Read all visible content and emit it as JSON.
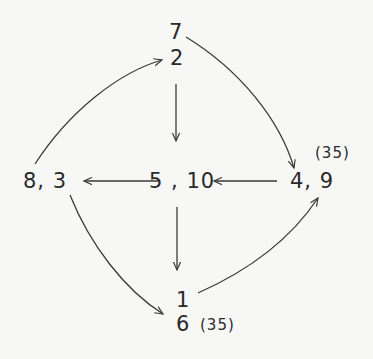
{
  "diagram": {
    "type": "directed-graph",
    "style": "hand-drawn",
    "colors": {
      "background": "#f7f7f6",
      "ink": "#2a2a2a"
    },
    "nodes": [
      {
        "id": "top",
        "lines": [
          "7",
          "2"
        ],
        "annotation": ""
      },
      {
        "id": "left",
        "label": "8, 3",
        "annotation": ""
      },
      {
        "id": "center",
        "label": "5 , 10",
        "annotation": ""
      },
      {
        "id": "right",
        "label": "4, 9",
        "annotation": "(35)"
      },
      {
        "id": "bottom",
        "lines": [
          "1",
          "6"
        ],
        "annotation": "(35)"
      }
    ],
    "labels": {
      "top_a": "7",
      "top_b": "2",
      "left": "8, 3",
      "center": "5 , 10",
      "right": "4, 9",
      "right_note": "(35)",
      "bottom_a": "1",
      "bottom_b": "6",
      "bottom_note": "(35)"
    },
    "edges": [
      {
        "from": "left",
        "to": "top",
        "shape": "curve"
      },
      {
        "from": "top",
        "to": "center",
        "shape": "straight"
      },
      {
        "from": "top",
        "to": "right",
        "shape": "curve"
      },
      {
        "from": "right",
        "to": "center",
        "shape": "straight"
      },
      {
        "from": "center",
        "to": "left",
        "shape": "straight"
      },
      {
        "from": "center",
        "to": "bottom",
        "shape": "straight"
      },
      {
        "from": "left",
        "to": "bottom",
        "shape": "curve"
      },
      {
        "from": "bottom",
        "to": "right",
        "shape": "curve"
      }
    ]
  }
}
